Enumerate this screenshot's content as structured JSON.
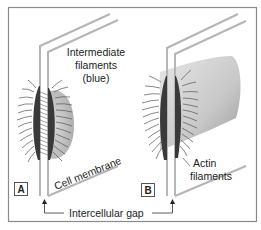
{
  "figure": {
    "panels": [
      {
        "id": "A",
        "label": "A"
      },
      {
        "id": "B",
        "label": "B"
      }
    ],
    "labels": {
      "intermediate_filaments": [
        "Intermediate",
        "filaments",
        "(blue)"
      ],
      "cell_membrane": "Cell membrane",
      "actin_filaments": [
        "Actin",
        "filaments"
      ],
      "intercellular_gap": "Intercellular gap"
    },
    "colors": {
      "membrane": "#b8b8b8",
      "plaque": "#3c3c3c",
      "filament": "#555555",
      "cytoplasm_shade": "#bdbdbd",
      "frame": "#888888"
    }
  }
}
